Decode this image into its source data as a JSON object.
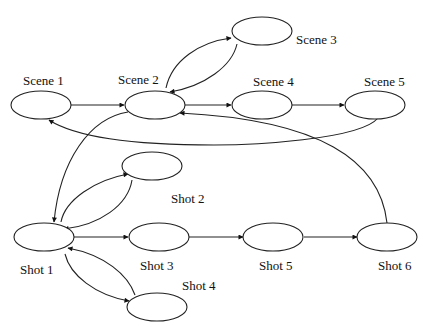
{
  "diagram": {
    "type": "directed-graph",
    "nodes": [
      {
        "id": "scene1",
        "label": "Scene 1"
      },
      {
        "id": "scene2",
        "label": "Scene 2"
      },
      {
        "id": "scene3",
        "label": "Scene 3"
      },
      {
        "id": "scene4",
        "label": "Scene 4"
      },
      {
        "id": "scene5",
        "label": "Scene 5"
      },
      {
        "id": "shot1",
        "label": "Shot 1"
      },
      {
        "id": "shot2",
        "label": "Shot 2"
      },
      {
        "id": "shot3",
        "label": "Shot 3"
      },
      {
        "id": "shot4",
        "label": "Shot 4"
      },
      {
        "id": "shot5",
        "label": "Shot 5"
      },
      {
        "id": "shot6",
        "label": "Shot 6"
      }
    ],
    "edges": [
      {
        "from": "scene1",
        "to": "scene2"
      },
      {
        "from": "scene2",
        "to": "scene3"
      },
      {
        "from": "scene3",
        "to": "scene2"
      },
      {
        "from": "scene2",
        "to": "scene4"
      },
      {
        "from": "scene4",
        "to": "scene5"
      },
      {
        "from": "scene5",
        "to": "scene1"
      },
      {
        "from": "scene2",
        "to": "shot1"
      },
      {
        "from": "shot1",
        "to": "shot2"
      },
      {
        "from": "shot2",
        "to": "shot1"
      },
      {
        "from": "shot1",
        "to": "shot3"
      },
      {
        "from": "shot1",
        "to": "shot4"
      },
      {
        "from": "shot4",
        "to": "shot1"
      },
      {
        "from": "shot3",
        "to": "shot5"
      },
      {
        "from": "shot5",
        "to": "shot6"
      },
      {
        "from": "shot6",
        "to": "scene2"
      }
    ]
  }
}
